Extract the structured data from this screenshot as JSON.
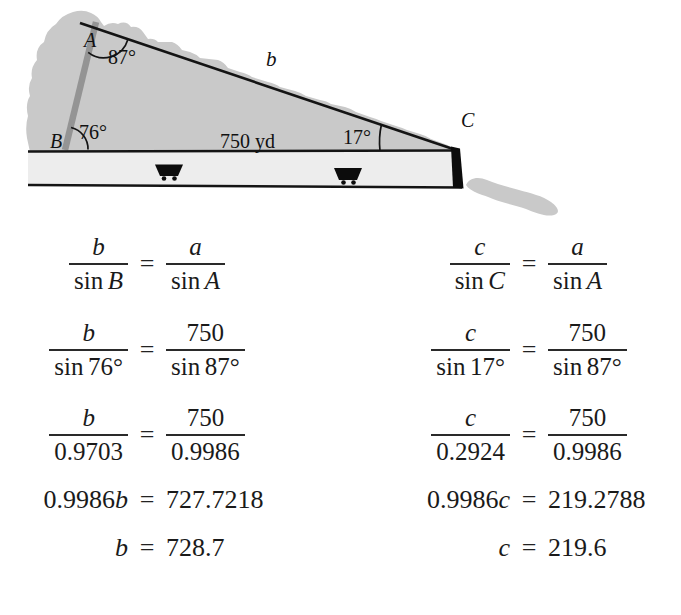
{
  "diagram": {
    "vertex_a": "A",
    "vertex_b": "B",
    "vertex_c": "C",
    "angle_at_a": "87°",
    "angle_at_b": "76°",
    "angle_at_c": "17°",
    "side_b": "b",
    "base_length": "750 yd",
    "colors": {
      "hill": "#c9c9c9",
      "tunnel_strip": "#ededed",
      "mine_shaft": "#949494",
      "line": "#141414"
    }
  },
  "eq_sign": "=",
  "law_left": {
    "r1": {
      "n1": "b",
      "fn1": "sin",
      "a1": "B",
      "n2": "a",
      "fn2": "sin",
      "a2": "A"
    },
    "r2": {
      "n1": "b",
      "fn1": "sin",
      "a1": "76°",
      "n2": "750",
      "fn2": "sin",
      "a2": "87°"
    },
    "r3": {
      "n1": "b",
      "d1": "0.9703",
      "n2": "750",
      "d2": "0.9986"
    },
    "r4": {
      "coef": "0.9986",
      "v": "b",
      "rhs": "727.7218"
    },
    "r5": {
      "v": "b",
      "rhs": "728.7"
    }
  },
  "law_right": {
    "r1": {
      "n1": "c",
      "fn1": "sin",
      "a1": "C",
      "n2": "a",
      "fn2": "sin",
      "a2": "A"
    },
    "r2": {
      "n1": "c",
      "fn1": "sin",
      "a1": "17°",
      "n2": "750",
      "fn2": "sin",
      "a2": "87°"
    },
    "r3": {
      "n1": "c",
      "d1": "0.2924",
      "n2": "750",
      "d2": "0.9986"
    },
    "r4": {
      "coef": "0.9986",
      "v": "c",
      "rhs": "219.2788"
    },
    "r5": {
      "v": "c",
      "rhs": "219.6"
    }
  }
}
